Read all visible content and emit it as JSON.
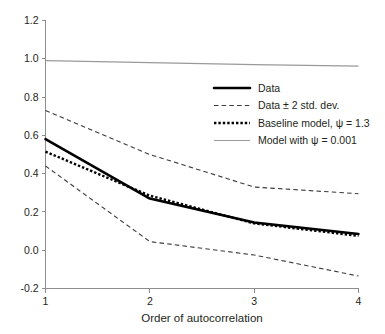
{
  "chart_data": {
    "type": "line",
    "title": "",
    "xlabel": "Order of autocorrelation",
    "ylabel": "",
    "xlim": [
      1,
      4
    ],
    "ylim": [
      -0.2,
      1.2
    ],
    "x": [
      1,
      2,
      3,
      4
    ],
    "xticks": [
      "1",
      "2",
      "3",
      "4"
    ],
    "yticks": [
      "1.2",
      "1.0",
      "0.8",
      "0.6",
      "0.4",
      "0.2",
      "0.0",
      "-0.2"
    ],
    "ytick_values": [
      1.2,
      1.0,
      0.8,
      0.6,
      0.4,
      0.2,
      0.0,
      -0.2
    ],
    "grid": false,
    "legend_position": "upper right",
    "series": [
      {
        "name": "Data",
        "style": "solid-thick",
        "color": "#000000",
        "values": [
          0.58,
          0.27,
          0.145,
          0.085
        ]
      },
      {
        "name": "Data + 2 std. dev.",
        "style": "dashed",
        "color": "#3a3a3a",
        "values": [
          0.73,
          0.5,
          0.33,
          0.295
        ]
      },
      {
        "name": "Data - 2 std. dev.",
        "style": "dashed",
        "color": "#3a3a3a",
        "values": [
          0.44,
          0.045,
          -0.025,
          -0.135
        ]
      },
      {
        "name": "Baseline model",
        "style": "dotted-thick",
        "color": "#000000",
        "values": [
          0.515,
          0.285,
          0.14,
          0.075
        ]
      },
      {
        "name": "Model with psi = 0.001",
        "style": "solid-thin-gray",
        "color": "#9a9a9a",
        "values": [
          0.99,
          0.98,
          0.97,
          0.962
        ]
      }
    ]
  },
  "legend": {
    "items": [
      {
        "label": "Data",
        "swatch": "solid-thick-line-swatch"
      },
      {
        "label": "Data ± 2 std. dev.",
        "swatch": "dashed-line-swatch"
      },
      {
        "label": "Baseline model, ψ = 1.3",
        "swatch": "dotted-line-swatch"
      },
      {
        "label": "Model with ψ = 0.001",
        "swatch": "thin-gray-line-swatch"
      }
    ]
  },
  "axes": {
    "x_title": "Order of autocorrelation",
    "x_tick_labels": [
      "1",
      "2",
      "3",
      "4"
    ],
    "y_tick_labels": [
      "1.2",
      "1.0",
      "0.8",
      "0.6",
      "0.4",
      "0.2",
      "0.0",
      "-0.2"
    ]
  },
  "colors": {
    "axis": "#8e8e8e",
    "data_line": "#000000",
    "band_line": "#3a3a3a",
    "model_line": "#9a9a9a",
    "text": "#231f20",
    "background": "#ffffff"
  }
}
